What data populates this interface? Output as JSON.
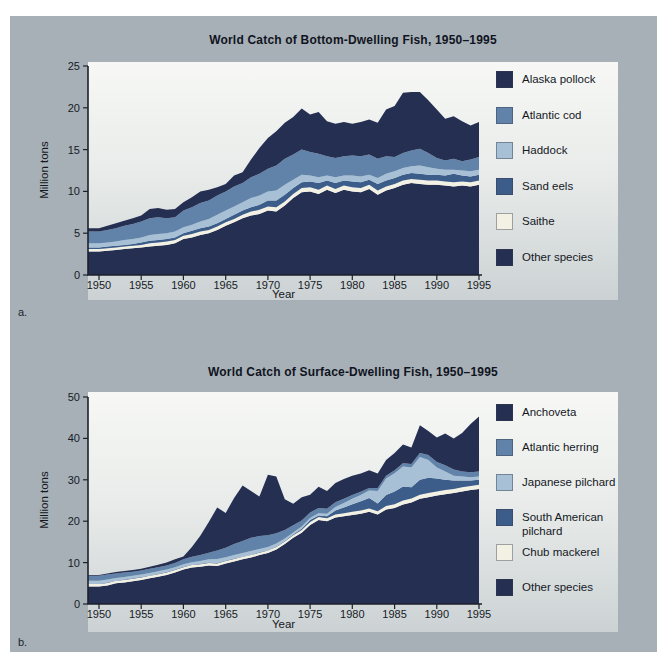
{
  "colors": {
    "page": "#ffffff",
    "panel": "#a7b0b6",
    "plot_background_top": "#f7f8f6",
    "plot_background_bottom": "#ccd2d4",
    "axis": "#1d212b",
    "text": "#14181f",
    "dark_navy": "#252f52",
    "steel_blue": "#6283a9",
    "light_blue": "#a7c0d6",
    "slate_blue": "#3c5c8a",
    "ivory": "#f2f1e4"
  },
  "chart_data": [
    {
      "id": "a",
      "panel_label": "a.",
      "type": "area",
      "stacked": true,
      "title": "World Catch of Bottom-Dwelling Fish, 1950–1995",
      "xlabel": "Year",
      "ylabel": "Million tons",
      "ylim": [
        0,
        25
      ],
      "xlim": [
        1950,
        1995
      ],
      "x_ticks": [
        1950,
        1955,
        1960,
        1965,
        1970,
        1975,
        1980,
        1985,
        1990,
        1995
      ],
      "y_ticks": [
        0,
        5,
        10,
        15,
        20,
        25
      ],
      "grid": false,
      "legend_position": "right",
      "values_note": "tops = cumulative stacked upper boundary of each layer, million tons, annual 1950-1995, estimated from figure",
      "years": [
        1950,
        1951,
        1952,
        1953,
        1954,
        1955,
        1956,
        1957,
        1958,
        1959,
        1960,
        1961,
        1962,
        1963,
        1964,
        1965,
        1966,
        1967,
        1968,
        1969,
        1970,
        1971,
        1972,
        1973,
        1974,
        1975,
        1976,
        1977,
        1978,
        1979,
        1980,
        1981,
        1982,
        1983,
        1984,
        1985,
        1986,
        1987,
        1988,
        1989,
        1990,
        1991,
        1992,
        1993,
        1994,
        1995
      ],
      "series": [
        {
          "name": "Other species",
          "color": "#252f52",
          "tops": [
            2.8,
            2.9,
            3.0,
            3.1,
            3.2,
            3.3,
            3.4,
            3.5,
            3.6,
            3.8,
            4.3,
            4.5,
            4.8,
            5.0,
            5.4,
            5.9,
            6.3,
            6.8,
            7.1,
            7.3,
            7.7,
            7.6,
            8.3,
            9.2,
            9.9,
            10.0,
            9.7,
            10.2,
            9.8,
            10.2,
            10.0,
            9.9,
            10.3,
            9.6,
            10.1,
            10.4,
            10.8,
            11.0,
            10.9,
            10.8,
            10.8,
            10.7,
            10.6,
            10.7,
            10.6,
            10.8
          ]
        },
        {
          "name": "Saithe",
          "color": "#f2f1e4",
          "tops": [
            3.1,
            3.2,
            3.3,
            3.4,
            3.5,
            3.6,
            3.8,
            3.9,
            4.0,
            4.2,
            4.7,
            4.9,
            5.2,
            5.4,
            5.8,
            6.3,
            6.7,
            7.2,
            7.6,
            7.8,
            8.2,
            8.1,
            8.8,
            9.7,
            10.4,
            10.5,
            10.2,
            10.7,
            10.3,
            10.7,
            10.5,
            10.4,
            10.8,
            10.1,
            10.6,
            10.9,
            11.3,
            11.5,
            11.4,
            11.3,
            11.3,
            11.2,
            11.1,
            11.2,
            11.1,
            11.3
          ]
        },
        {
          "name": "Sand eels",
          "color": "#3c5c8a",
          "tops": [
            3.3,
            3.4,
            3.5,
            3.6,
            3.7,
            3.9,
            4.1,
            4.2,
            4.3,
            4.5,
            5.0,
            5.3,
            5.6,
            5.8,
            6.2,
            6.7,
            7.2,
            7.7,
            8.1,
            8.4,
            8.9,
            8.9,
            9.6,
            10.4,
            11.1,
            11.2,
            11.0,
            11.3,
            11.0,
            11.3,
            11.2,
            11.1,
            11.4,
            10.9,
            11.3,
            11.6,
            12.0,
            12.2,
            12.1,
            12.0,
            12.0,
            11.9,
            12.1,
            11.9,
            11.8,
            12.0
          ]
        },
        {
          "name": "Haddock",
          "color": "#a7c0d6",
          "tops": [
            3.8,
            3.9,
            4.0,
            4.2,
            4.3,
            4.5,
            4.8,
            4.9,
            5.0,
            5.2,
            5.7,
            6.0,
            6.4,
            6.7,
            7.2,
            7.7,
            8.2,
            8.7,
            9.2,
            9.5,
            10.0,
            10.1,
            10.8,
            11.4,
            12.0,
            11.9,
            11.7,
            11.9,
            11.7,
            11.9,
            11.9,
            11.8,
            12.0,
            11.6,
            12.1,
            12.4,
            12.8,
            13.0,
            13.1,
            12.9,
            12.7,
            12.6,
            12.6,
            12.5,
            12.4,
            12.6
          ]
        },
        {
          "name": "Atlantic cod",
          "color": "#6283a9",
          "tops": [
            5.2,
            5.4,
            5.6,
            5.9,
            6.1,
            6.4,
            6.8,
            6.9,
            6.8,
            6.9,
            7.7,
            8.1,
            8.6,
            8.9,
            9.5,
            10.0,
            10.6,
            11.0,
            11.7,
            12.1,
            12.7,
            13.1,
            13.9,
            14.4,
            15.0,
            14.7,
            14.5,
            14.2,
            14.0,
            14.2,
            14.3,
            14.2,
            14.4,
            13.9,
            14.2,
            14.1,
            14.6,
            14.9,
            15.1,
            14.6,
            14.0,
            13.7,
            13.9,
            13.6,
            13.8,
            14.1
          ]
        },
        {
          "name": "Alaska pollock",
          "color": "#252f52",
          "tops": [
            5.6,
            5.9,
            6.2,
            6.5,
            6.8,
            7.1,
            7.9,
            8.0,
            7.8,
            7.9,
            8.7,
            9.3,
            10.0,
            10.2,
            10.5,
            10.9,
            11.9,
            12.3,
            13.8,
            15.2,
            16.4,
            17.2,
            18.2,
            18.9,
            19.9,
            19.2,
            19.5,
            18.4,
            18.1,
            18.3,
            18.1,
            18.3,
            18.6,
            18.2,
            19.8,
            20.2,
            21.8,
            21.9,
            21.9,
            20.9,
            19.8,
            18.7,
            19.0,
            18.4,
            17.9,
            18.3
          ]
        }
      ],
      "legend": [
        {
          "label": "Alaska pollock",
          "color": "#252f52"
        },
        {
          "label": "Atlantic cod",
          "color": "#6283a9"
        },
        {
          "label": "Haddock",
          "color": "#a7c0d6"
        },
        {
          "label": "Sand eels",
          "color": "#3c5c8a"
        },
        {
          "label": "Saithe",
          "color": "#f2f1e4"
        },
        {
          "label": "Other species",
          "color": "#252f52"
        }
      ]
    },
    {
      "id": "b",
      "panel_label": "b.",
      "type": "area",
      "stacked": true,
      "title": "World Catch of Surface-Dwelling Fish, 1950–1995",
      "xlabel": "Year",
      "ylabel": "Million tons",
      "ylim": [
        0,
        50
      ],
      "xlim": [
        1950,
        1995
      ],
      "x_ticks": [
        1950,
        1955,
        1960,
        1965,
        1970,
        1975,
        1980,
        1985,
        1990,
        1995
      ],
      "y_ticks": [
        0,
        10,
        20,
        30,
        40,
        50
      ],
      "grid": false,
      "legend_position": "right",
      "values_note": "tops = cumulative stacked upper boundary of each layer, million tons, annual 1950-1995, estimated from figure",
      "years": [
        1950,
        1951,
        1952,
        1953,
        1954,
        1955,
        1956,
        1957,
        1958,
        1959,
        1960,
        1961,
        1962,
        1963,
        1964,
        1965,
        1966,
        1967,
        1968,
        1969,
        1970,
        1971,
        1972,
        1973,
        1974,
        1975,
        1976,
        1977,
        1978,
        1979,
        1980,
        1981,
        1982,
        1983,
        1984,
        1985,
        1986,
        1987,
        1988,
        1989,
        1990,
        1991,
        1992,
        1993,
        1994,
        1995
      ],
      "series": [
        {
          "name": "Other species",
          "color": "#252f52",
          "tops": [
            4.2,
            4.5,
            5.0,
            5.2,
            5.5,
            5.8,
            6.2,
            6.6,
            7.0,
            7.6,
            8.3,
            8.8,
            9.0,
            9.3,
            9.2,
            9.8,
            10.3,
            10.8,
            11.2,
            11.8,
            12.3,
            13.2,
            14.5,
            16.0,
            17.2,
            19.1,
            20.3,
            20.0,
            20.9,
            21.2,
            21.5,
            21.8,
            22.3,
            21.6,
            22.8,
            23.2,
            24.0,
            24.5,
            25.4,
            25.8,
            26.2,
            26.5,
            26.8,
            27.2,
            27.5,
            27.8
          ]
        },
        {
          "name": "Chub mackerel",
          "color": "#f2f1e4",
          "tops": [
            4.8,
            5.1,
            5.6,
            5.8,
            6.1,
            6.4,
            6.8,
            7.2,
            7.6,
            8.2,
            8.9,
            9.4,
            9.6,
            9.9,
            9.8,
            10.4,
            10.9,
            11.4,
            11.8,
            12.4,
            12.9,
            13.8,
            15.1,
            16.6,
            17.9,
            19.8,
            21.0,
            20.7,
            21.6,
            21.9,
            22.3,
            22.6,
            23.1,
            22.4,
            23.7,
            24.1,
            25.0,
            25.5,
            26.4,
            26.8,
            27.2,
            27.5,
            27.8,
            28.2,
            28.5,
            28.8
          ]
        },
        {
          "name": "South American pilchard",
          "color": "#3c5c8a",
          "tops": [
            4.9,
            5.2,
            5.7,
            5.9,
            6.2,
            6.5,
            6.9,
            7.3,
            7.7,
            8.3,
            9.0,
            9.5,
            9.7,
            10.0,
            9.9,
            10.5,
            11.0,
            11.5,
            11.9,
            12.5,
            13.0,
            13.9,
            15.2,
            16.8,
            18.2,
            20.3,
            21.4,
            21.2,
            22.6,
            23.3,
            24.1,
            24.8,
            25.6,
            24.3,
            26.3,
            27.2,
            28.4,
            28.2,
            30.0,
            30.5,
            30.3,
            30.0,
            29.8,
            29.8,
            29.8,
            30.0
          ]
        },
        {
          "name": "Japanese pilchard",
          "color": "#a7c0d6",
          "tops": [
            5.6,
            5.9,
            6.3,
            6.5,
            6.8,
            7.1,
            7.5,
            7.9,
            8.3,
            8.9,
            9.6,
            10.1,
            10.4,
            10.8,
            10.9,
            11.3,
            11.8,
            12.3,
            12.8,
            13.3,
            13.8,
            14.6,
            15.8,
            17.3,
            18.7,
            20.8,
            21.9,
            21.8,
            23.4,
            24.4,
            25.4,
            26.3,
            27.4,
            27.3,
            30.3,
            31.6,
            33.2,
            33.0,
            35.5,
            34.8,
            33.0,
            32.0,
            31.0,
            30.8,
            30.6,
            30.8
          ]
        },
        {
          "name": "Atlantic herring",
          "color": "#6283a9",
          "tops": [
            6.8,
            7.1,
            7.4,
            7.6,
            7.8,
            8.1,
            8.5,
            8.9,
            9.3,
            9.9,
            10.8,
            11.4,
            11.8,
            12.4,
            12.9,
            13.6,
            14.5,
            15.2,
            16.0,
            16.4,
            16.6,
            17.1,
            17.9,
            19.0,
            20.2,
            22.1,
            23.2,
            23.0,
            24.6,
            25.4,
            26.3,
            27.1,
            28.0,
            28.0,
            31.0,
            32.3,
            34.0,
            33.8,
            36.5,
            36.0,
            34.3,
            33.5,
            32.5,
            32.0,
            31.8,
            32.0
          ]
        },
        {
          "name": "Anchoveta",
          "color": "#252f52",
          "tops": [
            7.0,
            7.4,
            7.7,
            8.0,
            8.2,
            8.5,
            9.0,
            9.5,
            10.0,
            10.8,
            11.5,
            13.8,
            16.5,
            19.8,
            23.3,
            22.0,
            25.6,
            28.6,
            27.3,
            26.0,
            31.2,
            30.8,
            25.3,
            24.2,
            25.8,
            26.4,
            28.3,
            27.3,
            29.2,
            30.2,
            31.0,
            31.5,
            32.3,
            31.5,
            34.8,
            36.5,
            38.5,
            37.8,
            43.2,
            41.8,
            40.2,
            41.2,
            40.0,
            41.3,
            43.5,
            45.3
          ]
        }
      ],
      "legend": [
        {
          "label": "Anchoveta",
          "color": "#252f52"
        },
        {
          "label": "Atlantic herring",
          "color": "#6283a9"
        },
        {
          "label": "Japanese pilchard",
          "color": "#a7c0d6"
        },
        {
          "label": "South American pilchard",
          "color": "#3c5c8a"
        },
        {
          "label": "Chub mackerel",
          "color": "#f2f1e4"
        },
        {
          "label": "Other species",
          "color": "#252f52"
        }
      ]
    }
  ]
}
